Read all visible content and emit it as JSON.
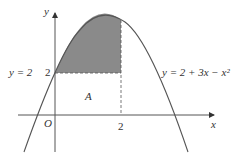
{
  "diagram": {
    "axis_x_label": "x",
    "axis_y_label": "y",
    "origin_label": "O",
    "tick_y_label": "2",
    "tick_x_label": "2",
    "line_label": "y = 2",
    "curve_label": "y = 2 + 3x − x²",
    "region_label": "A",
    "colors": {
      "shade": "#888888",
      "curve": "#555555",
      "axis": "#555555"
    }
  }
}
